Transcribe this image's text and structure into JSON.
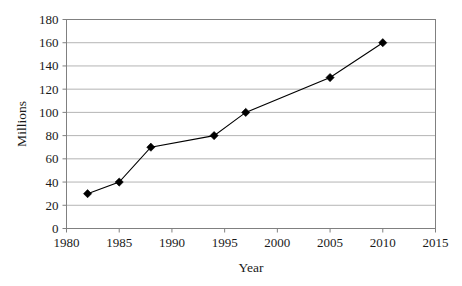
{
  "chart_data": {
    "type": "line",
    "title": "",
    "xlabel": "Year",
    "ylabel": "Millions",
    "xlim": [
      1980,
      2015
    ],
    "ylim": [
      0,
      180
    ],
    "xticks": [
      1980,
      1985,
      1990,
      1995,
      2000,
      2005,
      2010,
      2015
    ],
    "yticks": [
      0,
      20,
      40,
      60,
      80,
      100,
      120,
      140,
      160,
      180
    ],
    "xtick_labels": [
      "1980",
      "1985",
      "1990",
      "1995",
      "2000",
      "2005",
      "2010",
      "2015"
    ],
    "ytick_labels": [
      "0",
      "20",
      "40",
      "60",
      "80",
      "100",
      "120",
      "140",
      "160",
      "180"
    ],
    "grid": "horizontal",
    "legend": "none",
    "marker": "diamond",
    "line_color": "#000000",
    "marker_color": "#000000",
    "grid_color": "#b4b4b4",
    "frame_color": "#808080",
    "background": "#ffffff",
    "x": [
      1982,
      1985,
      1988,
      1994,
      1997,
      2005,
      2010
    ],
    "values": [
      30,
      40,
      70,
      80,
      100,
      130,
      160
    ],
    "series": [
      {
        "name": "Millions",
        "points": [
          {
            "x": 1982,
            "y": 30
          },
          {
            "x": 1985,
            "y": 40
          },
          {
            "x": 1988,
            "y": 70
          },
          {
            "x": 1994,
            "y": 80
          },
          {
            "x": 1997,
            "y": 100
          },
          {
            "x": 2005,
            "y": 130
          },
          {
            "x": 2010,
            "y": 160
          }
        ]
      }
    ]
  }
}
